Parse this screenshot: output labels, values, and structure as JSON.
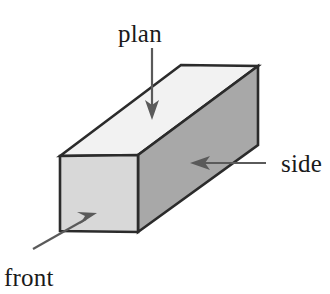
{
  "figure": {
    "background_color": "#ffffff",
    "width": 330,
    "height": 294
  },
  "labels": {
    "plan": "plan",
    "side": "side",
    "front": "front"
  },
  "colors": {
    "top_face": "#f2f2f2",
    "front_face": "#d8d8d8",
    "side_face": "#a8a8a8",
    "outline": "#2b2b2b",
    "arrow": "#5a5a5a",
    "leader": "#6e6e6e",
    "text": "#1a1a1a"
  },
  "geometry": {
    "front_face_points": "60,156 138,155 138,232 60,231",
    "top_face_points": "60,156 181,65 258,66 138,155",
    "side_face_points": "138,155 258,66 258,145 138,232",
    "front_top_left": [
      60,
      156
    ],
    "front_top_right": [
      138,
      155
    ],
    "front_bottom_right": [
      138,
      232
    ],
    "front_bottom_left": [
      60,
      231
    ],
    "back_top_left": [
      181,
      65
    ],
    "back_top_right": [
      258,
      66
    ],
    "back_bottom_right": [
      258,
      145
    ]
  },
  "annotations": {
    "plan_arrow": {
      "shaft": "152,48 152,107",
      "head": "152,120 145,100 152,105 159,100",
      "direction": "down"
    },
    "side_arrow": {
      "shaft": "266,163 203,163",
      "head": "190,163 210,156 205,163 210,170",
      "direction": "left"
    },
    "front_arrow": {
      "shaft": "33,249 86,219",
      "head": "97,213 80,224 85,216 77,212",
      "direction": "up-right"
    }
  },
  "label_positions": {
    "plan": {
      "x": 118,
      "y": 42
    },
    "side": {
      "x": 281,
      "y": 172
    },
    "front": {
      "x": 4,
      "y": 286
    }
  }
}
